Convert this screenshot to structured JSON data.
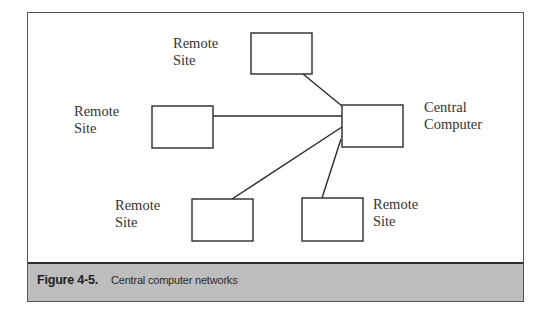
{
  "diagram": {
    "title": "Central computer networks",
    "nodes": [
      {
        "id": "remote-top",
        "label_line1": "Remote",
        "label_line2": "Site",
        "box": {
          "x": 251,
          "y": 33,
          "w": 61,
          "h": 41
        },
        "label_pos": {
          "x": 173,
          "y": 35
        }
      },
      {
        "id": "remote-left",
        "label_line1": "Remote",
        "label_line2": "Site",
        "box": {
          "x": 152,
          "y": 106,
          "w": 61,
          "h": 42
        },
        "label_pos": {
          "x": 74,
          "y": 103
        }
      },
      {
        "id": "central",
        "label_line1": "Central",
        "label_line2": "Computer",
        "box": {
          "x": 342,
          "y": 105,
          "w": 61,
          "h": 42
        },
        "label_pos": {
          "x": 424,
          "y": 99
        }
      },
      {
        "id": "remote-bottom-left",
        "label_line1": "Remote",
        "label_line2": "Site",
        "box": {
          "x": 192,
          "y": 199,
          "w": 61,
          "h": 42
        },
        "label_pos": {
          "x": 115,
          "y": 197
        }
      },
      {
        "id": "remote-bottom-right",
        "label_line1": "Remote",
        "label_line2": "Site",
        "box": {
          "x": 302,
          "y": 198,
          "w": 61,
          "h": 43
        },
        "label_pos": {
          "x": 373,
          "y": 196
        }
      }
    ],
    "links": [
      {
        "from": "remote-top",
        "to": "central"
      },
      {
        "from": "remote-left",
        "to": "central"
      },
      {
        "from": "remote-bottom-left",
        "to": "central"
      },
      {
        "from": "remote-bottom-right",
        "to": "central"
      }
    ]
  },
  "caption": {
    "number": "Figure 4-5.",
    "text": "Central computer networks",
    "band_color": "#bdbdbd"
  }
}
